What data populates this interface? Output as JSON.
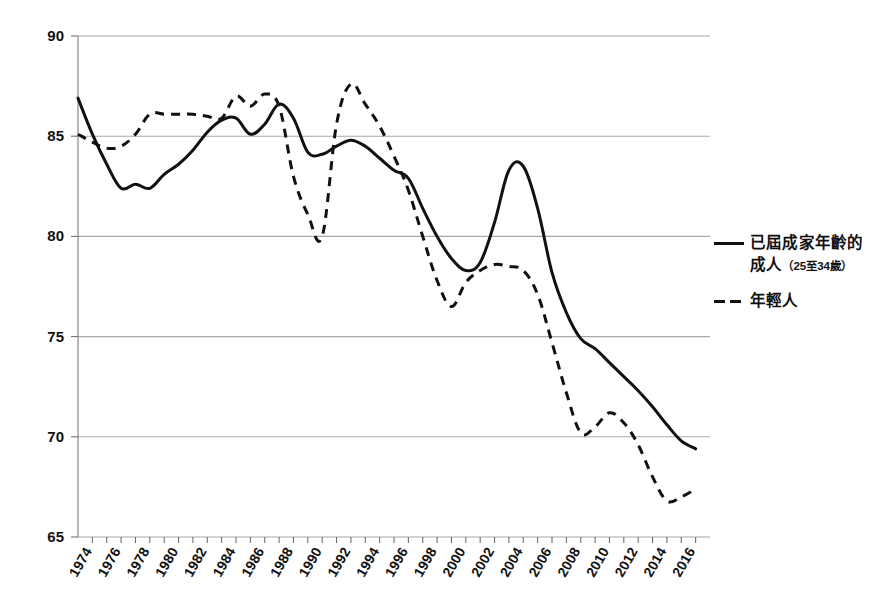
{
  "chart_data": {
    "type": "line",
    "title": "",
    "subtitle": "",
    "xlabel": "",
    "ylabel": "",
    "xlim": [
      1973,
      2017
    ],
    "ylim": [
      65,
      90
    ],
    "yticks": [
      65,
      70,
      75,
      80,
      85,
      90
    ],
    "grid": true,
    "legend_position": "right",
    "x": [
      1973,
      1974,
      1975,
      1976,
      1977,
      1978,
      1979,
      1980,
      1981,
      1982,
      1983,
      1984,
      1985,
      1986,
      1987,
      1988,
      1989,
      1990,
      1991,
      1992,
      1993,
      1994,
      1995,
      1996,
      1997,
      1998,
      1999,
      2000,
      2001,
      2002,
      2003,
      2004,
      2005,
      2006,
      2007,
      2008,
      2009,
      2010,
      2011,
      2012,
      2013,
      2014,
      2015,
      2016
    ],
    "xtick_labels": [
      "1974",
      "1976",
      "1978",
      "1980",
      "1982",
      "1984",
      "1986",
      "1988",
      "1990",
      "1992",
      "1994",
      "1996",
      "1998",
      "2000",
      "2002",
      "2004",
      "2006",
      "2008",
      "2010",
      "2012",
      "2014",
      "2016"
    ],
    "series": [
      {
        "name": "已屆成家年齡的成人（25至34歲）",
        "style": "solid",
        "color": "#111111",
        "values": [
          86.9,
          85.1,
          83.6,
          82.4,
          82.6,
          82.4,
          83.1,
          83.6,
          84.3,
          85.2,
          85.8,
          85.9,
          85.1,
          85.6,
          86.6,
          85.9,
          84.2,
          84.1,
          84.5,
          84.8,
          84.5,
          83.9,
          83.3,
          82.9,
          81.4,
          80.0,
          78.9,
          78.3,
          78.7,
          80.7,
          83.3,
          83.5,
          81.4,
          78.2,
          76.2,
          74.9,
          74.4,
          73.7,
          73.0,
          72.3,
          71.5,
          70.6,
          69.8,
          69.4
        ]
      },
      {
        "name": "年輕人",
        "style": "dashed",
        "color": "#111111",
        "values": [
          85.1,
          84.7,
          84.4,
          84.5,
          85.1,
          86.1,
          86.1,
          86.1,
          86.1,
          86.0,
          85.9,
          87.0,
          86.5,
          87.1,
          86.5,
          83.0,
          81.1,
          80.0,
          85.6,
          87.6,
          86.6,
          85.5,
          84.0,
          82.3,
          80.0,
          77.8,
          76.5,
          77.7,
          78.3,
          78.6,
          78.5,
          78.3,
          77.1,
          74.7,
          72.2,
          70.2,
          70.5,
          71.2,
          70.7,
          69.6,
          68.0,
          66.8,
          67.0,
          67.4
        ]
      }
    ]
  },
  "legend": {
    "items": [
      {
        "swatch": "solid-line",
        "label_line1": "已屆成家年齡的",
        "label_line2_main": "成人",
        "label_line2_paren": "（25至34歲）"
      },
      {
        "swatch": "dashed-line",
        "label_line1": "年輕人",
        "label_line2_main": "",
        "label_line2_paren": ""
      }
    ]
  }
}
